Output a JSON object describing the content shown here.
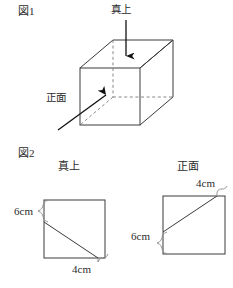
{
  "figure1": {
    "label": "図1",
    "shape": "cube",
    "direction_labels": {
      "top": "真上",
      "front": "正面"
    },
    "arrows": [
      {
        "name": "top-view-arrow",
        "points_to": "真上",
        "direction": "down"
      },
      {
        "name": "front-view-arrow",
        "points_to": "正面",
        "direction": "up-right"
      }
    ],
    "geometry": {
      "front_face": {
        "x1": 80,
        "y1": 68,
        "x2": 140,
        "y2": 125
      },
      "depth_offset": {
        "dx": 33,
        "dy": -28
      },
      "hidden_edges": "dashed"
    }
  },
  "figure2": {
    "label": "図2",
    "views": [
      {
        "name": "top-view",
        "title": "真上",
        "square": {
          "x": 44,
          "y": 200,
          "size": 61
        },
        "diagonal": {
          "from": "left-edge",
          "to": "bottom-edge"
        },
        "dimensions": [
          {
            "name": "left-dimension",
            "value": "6cm",
            "edge": "left",
            "from": "top"
          },
          {
            "name": "bottom-dimension",
            "value": "4cm",
            "edge": "bottom",
            "from": "right"
          }
        ]
      },
      {
        "name": "front-view",
        "title": "正面",
        "square": {
          "x": 163,
          "y": 196,
          "size": 62
        },
        "diagonal": {
          "from": "left-edge",
          "to": "top-edge"
        },
        "dimensions": [
          {
            "name": "top-dimension",
            "value": "4cm",
            "edge": "top",
            "from": "right"
          },
          {
            "name": "left-dimension",
            "value": "6cm",
            "edge": "left",
            "from": "bottom"
          }
        ]
      }
    ]
  },
  "colors": {
    "ink": "#1a1a1a",
    "line": "#3a3a3a",
    "paper": "#ffffff"
  }
}
